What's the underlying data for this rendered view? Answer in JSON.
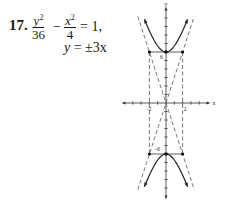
{
  "problem": {
    "number": "17.",
    "term1_num": "y",
    "term1_exp": "2",
    "term1_den": "36",
    "minus": "−",
    "term2_num": "x",
    "term2_exp": "2",
    "term2_den": "4",
    "equals_rhs": "= 1,",
    "asymptote_lhs": "y",
    "asymptote_rhs": "=  ±3x"
  },
  "chart_data": {
    "type": "line",
    "title": "",
    "equation": "y^2/36 - x^2/4 = 1",
    "asymptotes": [
      "y = 3x",
      "y = -3x"
    ],
    "xlabel": "x",
    "ylabel": "y",
    "x_tick_labels": [
      "-2",
      "2"
    ],
    "y_tick_labels": [
      "6",
      "-6"
    ],
    "xlim": [
      -5,
      5
    ],
    "ylim": [
      -11,
      11
    ],
    "vertices": [
      [
        0,
        6
      ],
      [
        0,
        -6
      ]
    ],
    "rectangle_corners": [
      [
        -2,
        6
      ],
      [
        2,
        6
      ],
      [
        -2,
        -6
      ],
      [
        2,
        -6
      ]
    ],
    "branches": [
      {
        "name": "upper",
        "x_range": [
          -2.6,
          2.6
        ]
      },
      {
        "name": "lower",
        "x_range": [
          -2.6,
          2.6
        ]
      }
    ]
  }
}
